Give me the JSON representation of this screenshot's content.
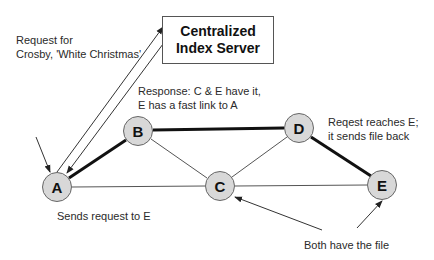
{
  "server": {
    "line1": "Centralized",
    "line2": "Index Server"
  },
  "nodes": [
    {
      "id": "A",
      "label": "A",
      "x": 57,
      "y": 187
    },
    {
      "id": "B",
      "label": "B",
      "x": 138,
      "y": 131
    },
    {
      "id": "C",
      "label": "C",
      "x": 220,
      "y": 186
    },
    {
      "id": "D",
      "label": "D",
      "x": 299,
      "y": 128
    },
    {
      "id": "E",
      "label": "E",
      "x": 382,
      "y": 185
    }
  ],
  "edges": [
    {
      "from": "A",
      "to": "B",
      "weight": "thick"
    },
    {
      "from": "B",
      "to": "D",
      "weight": "thick"
    },
    {
      "from": "D",
      "to": "E",
      "weight": "thick"
    },
    {
      "from": "A",
      "to": "C",
      "weight": "thin"
    },
    {
      "from": "B",
      "to": "C",
      "weight": "thin"
    },
    {
      "from": "C",
      "to": "D",
      "weight": "thin"
    },
    {
      "from": "C",
      "to": "E",
      "weight": "thin"
    }
  ],
  "annotations": {
    "request_line1": "Request for",
    "request_line2": "Crosby, 'White Christmas'",
    "response_line1": "Response: C & E have it,",
    "response_line2": "E has a fast link to A",
    "reaches_line1": "Reqest reaches E;",
    "reaches_line2": "it sends file back",
    "sends": "Sends request to E",
    "both": "Both have the file"
  }
}
